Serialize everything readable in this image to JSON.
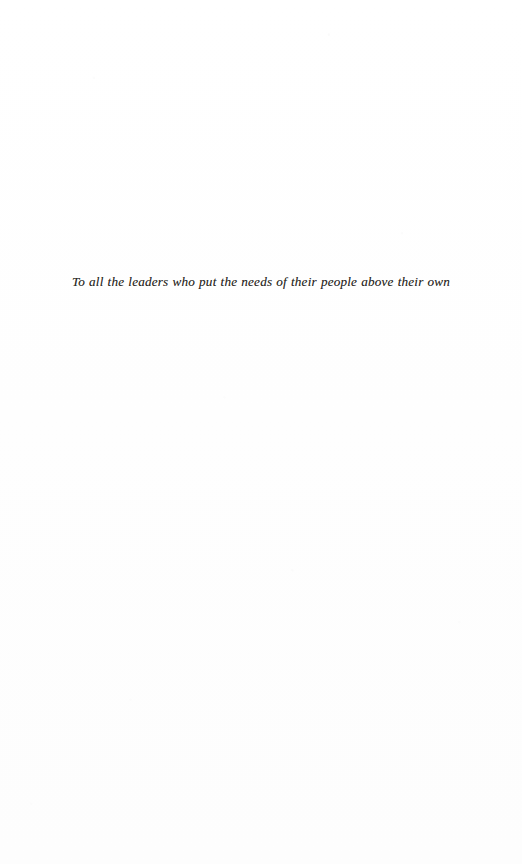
{
  "page": {
    "kind": "book-dedication-page",
    "width": 522,
    "height": 864,
    "background_color": "#fefefe",
    "page_number": ""
  },
  "dedication": {
    "text": "To all the leaders who put the needs of their people above their own",
    "style": "italic",
    "alignment": "center",
    "text_color": "#2a2824"
  }
}
